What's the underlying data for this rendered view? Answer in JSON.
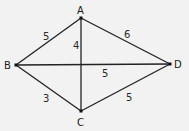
{
  "diagram": {
    "type": "graph",
    "vertices": [
      {
        "id": "A",
        "label": "A",
        "x": 81,
        "y": 18
      },
      {
        "id": "B",
        "label": "B",
        "x": 16,
        "y": 65
      },
      {
        "id": "C",
        "label": "C",
        "x": 81,
        "y": 111
      },
      {
        "id": "D",
        "label": "D",
        "x": 170,
        "y": 64
      }
    ],
    "edges": [
      {
        "from": "A",
        "to": "B",
        "weight": "5"
      },
      {
        "from": "A",
        "to": "D",
        "weight": "6"
      },
      {
        "from": "A",
        "to": "C",
        "weight": "4"
      },
      {
        "from": "B",
        "to": "D",
        "weight": "5"
      },
      {
        "from": "B",
        "to": "C",
        "weight": "3"
      },
      {
        "from": "C",
        "to": "D",
        "weight": "5"
      }
    ]
  }
}
